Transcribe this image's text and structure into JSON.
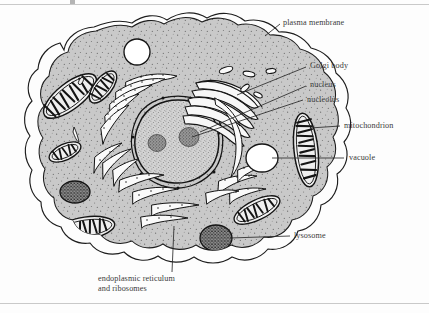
{
  "figure": {
    "kind": "labelled biological diagram",
    "colors": {
      "cytoplasm": "#c9c9c9",
      "cytoplasm_speckle": "#6e6e6e",
      "membrane_line": "#1d1d1d",
      "nucleoplasm": "#cfcfcf",
      "nucleolus": "#8f8f8f",
      "vacuole_fill": "#ffffff",
      "lysosome_fill": "#6a6a6a",
      "organelle_outline": "#161616",
      "label_text": "#3b3b3b",
      "leader_line": "#2a2a2a",
      "page_background": "#fdfdfd",
      "rule": "#c9c9c9"
    }
  },
  "labels": [
    {
      "id": "plasma-membrane",
      "text": "plasma membrane"
    },
    {
      "id": "golgi-body",
      "text": "Golgi body"
    },
    {
      "id": "nucleus",
      "text": "nucleus"
    },
    {
      "id": "nucleolus",
      "text": "nucleolus"
    },
    {
      "id": "mitochondrion",
      "text": "mitochondrion"
    },
    {
      "id": "vacuole",
      "text": "vacuole"
    },
    {
      "id": "lysosome",
      "text": "lysosome"
    },
    {
      "id": "er",
      "line1": "endoplasmic reticulum",
      "line2": "and ribosomes"
    }
  ],
  "structures": {
    "plasma_membrane": "double outer boundary line enclosing the cell",
    "cytoplasm": "stippled grey interior fill",
    "nucleus": "large stippled oval, centre-left of cell",
    "nucleoli": 2,
    "mitochondria_count": 7,
    "vacuoles_count": 2,
    "lysosomes_count": 3,
    "golgi_stacks": 1,
    "er_cisternae": "numerous elongated ribosome-studded tubes around the nucleus"
  }
}
